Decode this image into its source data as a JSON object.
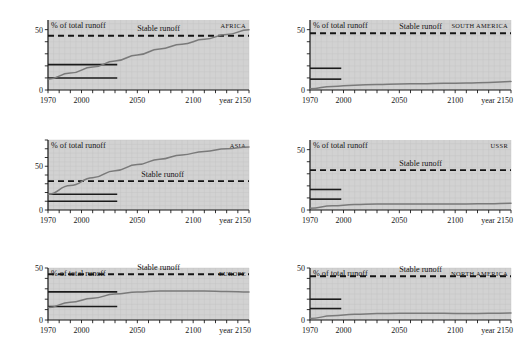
{
  "figure": {
    "background_color": "#ffffff",
    "plot_background_color": "#d2d2d2",
    "curve_color": "#7a7a7a",
    "stable_line_color": "#141414",
    "axis_color": "#1b1b1b"
  },
  "common": {
    "ylabel": "% of total runoff",
    "stable_label": "Stable runoff",
    "x_tick_labels": [
      "1970",
      "2000",
      "2050",
      "2100",
      "year 2150"
    ],
    "x_tick_values": [
      1970,
      2000,
      2050,
      2100,
      2150
    ],
    "x_minor_step": 10,
    "y_tick_labels": [
      "0",
      "50"
    ],
    "y_tick_values": [
      0,
      50
    ],
    "xlim": [
      1970,
      2150
    ]
  },
  "chart_data": [
    {
      "type": "line",
      "title": "AFRICA",
      "xlabel": "year 2150",
      "ylabel": "% of total runoff",
      "xlim": [
        1970,
        2150
      ],
      "ylim": [
        0,
        58
      ],
      "grid": true,
      "legend": "none",
      "annotations": [
        "Stable runoff"
      ],
      "stable_runoff": 45,
      "historic_bars": [
        {
          "value": 21,
          "x_start": 1970,
          "x_end": 2032
        },
        {
          "value": 10,
          "x_start": 1970,
          "x_end": 2032
        }
      ],
      "series": [
        {
          "name": "withdrawal",
          "x": [
            1970,
            1990,
            2010,
            2030,
            2050,
            2070,
            2090,
            2110,
            2130,
            2150
          ],
          "values": [
            9,
            14,
            19,
            24,
            29,
            34,
            38,
            42,
            46,
            50
          ]
        }
      ]
    },
    {
      "type": "line",
      "title": "SOUTH AMERICA",
      "xlabel": "year 2150",
      "ylabel": "% of total runoff",
      "xlim": [
        1970,
        2150
      ],
      "ylim": [
        0,
        58
      ],
      "grid": true,
      "legend": "none",
      "annotations": [
        "Stable runoff"
      ],
      "stable_runoff": 47,
      "historic_bars": [
        {
          "value": 18,
          "x_start": 1970,
          "x_end": 1998
        },
        {
          "value": 9,
          "x_start": 1970,
          "x_end": 1998
        }
      ],
      "series": [
        {
          "name": "withdrawal",
          "x": [
            1970,
            1990,
            2010,
            2030,
            2050,
            2070,
            2090,
            2110,
            2130,
            2150
          ],
          "values": [
            1,
            3,
            4,
            4.5,
            5,
            5.2,
            5.5,
            5.8,
            6.2,
            7
          ]
        }
      ]
    },
    {
      "type": "line",
      "title": "ASIA",
      "xlabel": "year 2150",
      "ylabel": "% of total runoff",
      "xlim": [
        1970,
        2150
      ],
      "ylim": [
        0,
        80
      ],
      "grid": true,
      "legend": "none",
      "annotations": [
        "Stable runoff"
      ],
      "stable_runoff": 33,
      "historic_bars": [
        {
          "value": 18,
          "x_start": 1970,
          "x_end": 2032
        },
        {
          "value": 10,
          "x_start": 1970,
          "x_end": 2032
        }
      ],
      "series": [
        {
          "name": "withdrawal",
          "x": [
            1970,
            1990,
            2010,
            2030,
            2050,
            2070,
            2090,
            2110,
            2130,
            2150
          ],
          "values": [
            18,
            28,
            37,
            45,
            52,
            58,
            63,
            67,
            70,
            72
          ]
        }
      ]
    },
    {
      "type": "line",
      "title": "USSR",
      "xlabel": "year 2150",
      "ylabel": "% of total runoff",
      "xlim": [
        1970,
        2150
      ],
      "ylim": [
        0,
        58
      ],
      "grid": true,
      "legend": "none",
      "annotations": [
        "Stable runoff"
      ],
      "stable_runoff": 33,
      "historic_bars": [
        {
          "value": 17,
          "x_start": 1970,
          "x_end": 1998
        },
        {
          "value": 9,
          "x_start": 1970,
          "x_end": 1998
        }
      ],
      "series": [
        {
          "name": "withdrawal",
          "x": [
            1970,
            1990,
            2010,
            2030,
            2050,
            2070,
            2090,
            2110,
            2130,
            2150
          ],
          "values": [
            1.5,
            3.5,
            4.5,
            5,
            5,
            5,
            5,
            5,
            5.2,
            5.5
          ]
        }
      ]
    },
    {
      "type": "line",
      "title": "EUROPE",
      "xlabel": "year 2150",
      "ylabel": "% of total runoff",
      "xlim": [
        1970,
        2150
      ],
      "ylim": [
        0,
        50
      ],
      "grid": true,
      "legend": "none",
      "annotations": [
        "Stable runoff"
      ],
      "stable_runoff": 44,
      "historic_bars": [
        {
          "value": 27,
          "x_start": 1970,
          "x_end": 2032
        },
        {
          "value": 13,
          "x_start": 1970,
          "x_end": 2032
        }
      ],
      "series": [
        {
          "name": "withdrawal",
          "x": [
            1970,
            1990,
            2010,
            2030,
            2050,
            2070,
            2090,
            2110,
            2130,
            2150
          ],
          "values": [
            12,
            17,
            21,
            25,
            27,
            28,
            28,
            28,
            27.5,
            27
          ]
        }
      ]
    },
    {
      "type": "line",
      "title": "NORTH AMERICA",
      "xlabel": "year 2150",
      "ylabel": "% of total runoff",
      "xlim": [
        1970,
        2150
      ],
      "ylim": [
        0,
        50
      ],
      "grid": true,
      "legend": "none",
      "annotations": [
        "Stable runoff"
      ],
      "stable_runoff": 42,
      "historic_bars": [
        {
          "value": 20,
          "x_start": 1970,
          "x_end": 1998
        },
        {
          "value": 11,
          "x_start": 1970,
          "x_end": 1998
        }
      ],
      "series": [
        {
          "name": "withdrawal",
          "x": [
            1970,
            1990,
            2010,
            2030,
            2050,
            2070,
            2090,
            2110,
            2130,
            2150
          ],
          "values": [
            1.5,
            4,
            5.5,
            6.2,
            6.5,
            6.5,
            6.4,
            6.3,
            6.4,
            6.8
          ]
        }
      ]
    }
  ]
}
